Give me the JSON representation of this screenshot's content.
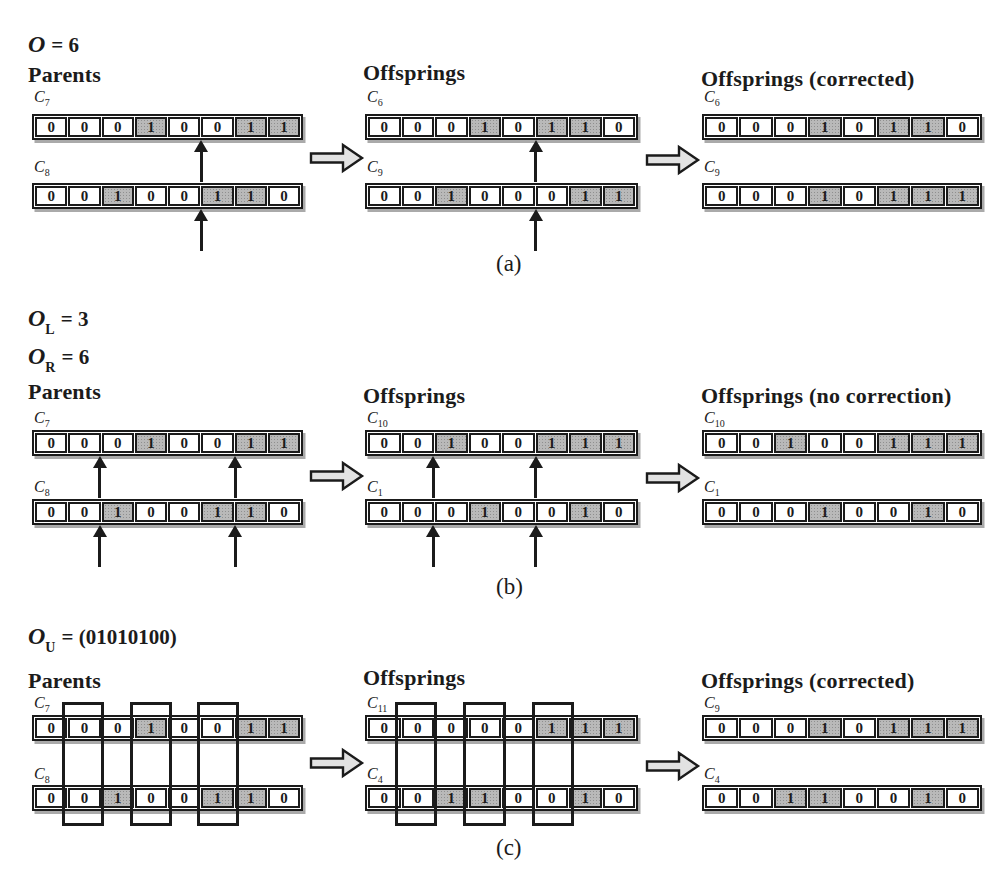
{
  "figure": {
    "colors": {
      "background": "#ffffff",
      "cell_bg": "#ffffff",
      "cell_shaded": "#b9b9b9",
      "line": "#1b1b1b",
      "block_arrow_fill": "#e2e2e2",
      "row_shadow": "#aaaaaa"
    },
    "sections": [
      {
        "id": "a",
        "caption": "(a)",
        "params": [
          {
            "sym": "O",
            "sub": "",
            "eq": "= 6"
          }
        ],
        "panels": [
          {
            "key": "parents",
            "title": "Parents",
            "box_cells": [],
            "rows": [
              {
                "chrom": "C",
                "sub": "7",
                "cells": [
                  "0",
                  "0",
                  "0",
                  "1",
                  "0",
                  "0",
                  "1",
                  "1"
                ],
                "shaded": [
                  4,
                  7,
                  8
                ],
                "cut_arrows": [
                  5
                ]
              },
              {
                "chrom": "C",
                "sub": "8",
                "cells": [
                  "0",
                  "0",
                  "1",
                  "0",
                  "0",
                  "1",
                  "1",
                  "0"
                ],
                "shaded": [
                  3,
                  6,
                  7
                ],
                "cut_arrows": [
                  5
                ]
              }
            ]
          },
          {
            "key": "offsprings",
            "title": "Offsprings",
            "box_cells": [],
            "rows": [
              {
                "chrom": "C",
                "sub": "6",
                "cells": [
                  "0",
                  "0",
                  "0",
                  "1",
                  "0",
                  "1",
                  "1",
                  "0"
                ],
                "shaded": [
                  4,
                  6,
                  7
                ],
                "cut_arrows": [
                  5
                ]
              },
              {
                "chrom": "C",
                "sub": "9",
                "cells": [
                  "0",
                  "0",
                  "1",
                  "0",
                  "0",
                  "0",
                  "1",
                  "1"
                ],
                "shaded": [
                  3,
                  7,
                  8
                ],
                "cut_arrows": [
                  5
                ]
              }
            ]
          },
          {
            "key": "offsprings-corrected",
            "title": "Offsprings (corrected)",
            "box_cells": [],
            "rows": [
              {
                "chrom": "C",
                "sub": "6",
                "cells": [
                  "0",
                  "0",
                  "0",
                  "1",
                  "0",
                  "1",
                  "1",
                  "0"
                ],
                "shaded": [
                  4,
                  6,
                  7
                ],
                "cut_arrows": []
              },
              {
                "chrom": "C",
                "sub": "9",
                "cells": [
                  "0",
                  "0",
                  "0",
                  "1",
                  "0",
                  "1",
                  "1",
                  "1"
                ],
                "shaded": [
                  4,
                  6,
                  7,
                  8
                ],
                "cut_arrows": []
              }
            ]
          }
        ]
      },
      {
        "id": "b",
        "caption": "(b)",
        "params": [
          {
            "sym": "O",
            "sub": "L",
            "eq": "= 3"
          },
          {
            "sym": "O",
            "sub": "R",
            "eq": "= 6"
          }
        ],
        "panels": [
          {
            "key": "parents",
            "title": "Parents",
            "box_cells": [],
            "rows": [
              {
                "chrom": "C",
                "sub": "7",
                "cells": [
                  "0",
                  "0",
                  "0",
                  "1",
                  "0",
                  "0",
                  "1",
                  "1"
                ],
                "shaded": [
                  4,
                  7,
                  8
                ],
                "cut_arrows": [
                  2,
                  6
                ]
              },
              {
                "chrom": "C",
                "sub": "8",
                "cells": [
                  "0",
                  "0",
                  "1",
                  "0",
                  "0",
                  "1",
                  "1",
                  "0"
                ],
                "shaded": [
                  3,
                  6,
                  7
                ],
                "cut_arrows": [
                  2,
                  6
                ]
              }
            ]
          },
          {
            "key": "offsprings",
            "title": "Offsprings",
            "box_cells": [],
            "rows": [
              {
                "chrom": "C",
                "sub": "10",
                "cells": [
                  "0",
                  "0",
                  "1",
                  "0",
                  "0",
                  "1",
                  "1",
                  "1"
                ],
                "shaded": [
                  3,
                  6,
                  7,
                  8
                ],
                "cut_arrows": [
                  2,
                  5
                ]
              },
              {
                "chrom": "C",
                "sub": "1",
                "cells": [
                  "0",
                  "0",
                  "0",
                  "1",
                  "0",
                  "0",
                  "1",
                  "0"
                ],
                "shaded": [
                  4,
                  7
                ],
                "cut_arrows": [
                  2,
                  5
                ]
              }
            ]
          },
          {
            "key": "offsprings-no-correction",
            "title": "Offsprings (no correction)",
            "box_cells": [],
            "rows": [
              {
                "chrom": "C",
                "sub": "10",
                "cells": [
                  "0",
                  "0",
                  "1",
                  "0",
                  "0",
                  "1",
                  "1",
                  "1"
                ],
                "shaded": [
                  3,
                  6,
                  7,
                  8
                ],
                "cut_arrows": []
              },
              {
                "chrom": "C",
                "sub": "1",
                "cells": [
                  "0",
                  "0",
                  "0",
                  "1",
                  "0",
                  "0",
                  "1",
                  "0"
                ],
                "shaded": [
                  4,
                  7
                ],
                "cut_arrows": []
              }
            ]
          }
        ]
      },
      {
        "id": "c",
        "caption": "(c)",
        "params": [
          {
            "sym": "O",
            "sub": "U",
            "eq": "= (01010100)"
          }
        ],
        "panels": [
          {
            "key": "parents",
            "title": "Parents",
            "box_cells": [
              2,
              4,
              6
            ],
            "rows": [
              {
                "chrom": "C",
                "sub": "7",
                "cells": [
                  "0",
                  "0",
                  "0",
                  "1",
                  "0",
                  "0",
                  "1",
                  "1"
                ],
                "shaded": [
                  4,
                  7,
                  8
                ],
                "cut_arrows": []
              },
              {
                "chrom": "C",
                "sub": "8",
                "cells": [
                  "0",
                  "0",
                  "1",
                  "0",
                  "0",
                  "1",
                  "1",
                  "0"
                ],
                "shaded": [
                  3,
                  6,
                  7
                ],
                "cut_arrows": []
              }
            ]
          },
          {
            "key": "offsprings",
            "title": "Offsprings",
            "box_cells": [
              2,
              4,
              6
            ],
            "rows": [
              {
                "chrom": "C",
                "sub": "11",
                "cells": [
                  "0",
                  "0",
                  "0",
                  "0",
                  "0",
                  "1",
                  "1",
                  "1"
                ],
                "shaded": [
                  6,
                  7,
                  8
                ],
                "cut_arrows": []
              },
              {
                "chrom": "C",
                "sub": "4",
                "cells": [
                  "0",
                  "0",
                  "1",
                  "1",
                  "0",
                  "0",
                  "1",
                  "0"
                ],
                "shaded": [
                  3,
                  4,
                  7
                ],
                "cut_arrows": []
              }
            ]
          },
          {
            "key": "offsprings-corrected",
            "title": "Offsprings (corrected)",
            "box_cells": [],
            "rows": [
              {
                "chrom": "C",
                "sub": "9",
                "cells": [
                  "0",
                  "0",
                  "0",
                  "1",
                  "0",
                  "1",
                  "1",
                  "1"
                ],
                "shaded": [
                  4,
                  6,
                  7,
                  8
                ],
                "cut_arrows": []
              },
              {
                "chrom": "C",
                "sub": "4",
                "cells": [
                  "0",
                  "0",
                  "1",
                  "1",
                  "0",
                  "0",
                  "1",
                  "0"
                ],
                "shaded": [
                  3,
                  4,
                  7
                ],
                "cut_arrows": []
              }
            ]
          }
        ]
      }
    ]
  }
}
